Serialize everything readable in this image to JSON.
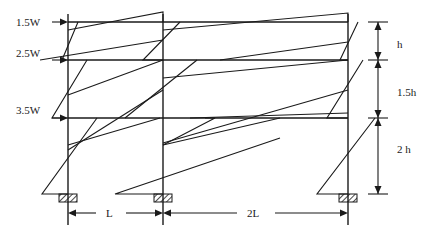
{
  "diagram": {
    "loads": [
      {
        "label": "1.5W",
        "level": "roof"
      },
      {
        "label": "2.5W",
        "level": "floor-2"
      },
      {
        "label": "3.5W",
        "level": "floor-1"
      }
    ],
    "story_heights": [
      {
        "label": "h"
      },
      {
        "label": "1.5h"
      },
      {
        "label": "2 h"
      }
    ],
    "bay_spans": [
      {
        "label": "L"
      },
      {
        "label": "2L"
      }
    ],
    "columns": 3,
    "stories": 3,
    "colors": {
      "line": "#1a1a1a",
      "background": "#ffffff"
    }
  }
}
